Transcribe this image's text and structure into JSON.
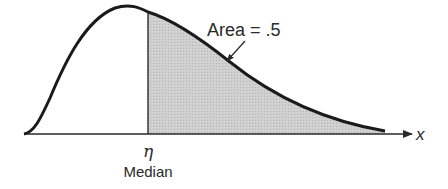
{
  "diagram": {
    "area_label": "Area = .5",
    "x_axis_label": "x",
    "median_symbol": "η",
    "median_label": "Median",
    "shaded_region": "right of median",
    "shaded_area_fraction": 0.5,
    "colors": {
      "curve": "#1a1a1a",
      "shade": "#c9c9c9",
      "axis": "#2a2a2a",
      "text": "#2a2a2a"
    }
  }
}
